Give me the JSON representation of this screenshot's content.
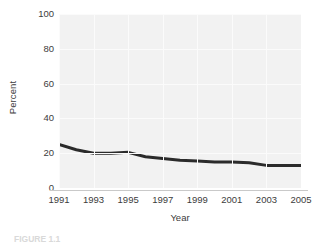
{
  "figure": {
    "caption_clipped": "FIGURE 1.1",
    "background_color": "#ffffff",
    "plot_background_color": "#f2f2f2",
    "gridline_color": "#fbfbfb",
    "axis_line_color": "#c9c9c9",
    "series_color": "#2b2b2b",
    "text_color": "#3c3c3c"
  },
  "chart_data": {
    "type": "line",
    "title": "",
    "xlabel": "Year",
    "ylabel": "Percent",
    "xlim": [
      1991,
      2005
    ],
    "ylim": [
      0,
      100
    ],
    "grid": true,
    "legend": false,
    "legend_position": "none",
    "x_tick_labels": [
      "1991",
      "1993",
      "1995",
      "1997",
      "1999",
      "2001",
      "2003",
      "2005"
    ],
    "x_ticks": [
      1991,
      1993,
      1995,
      1997,
      1999,
      2001,
      2003,
      2005
    ],
    "y_tick_labels": [
      "0",
      "20",
      "40",
      "60",
      "80",
      "100"
    ],
    "y_ticks": [
      0,
      20,
      40,
      60,
      80,
      100
    ],
    "x": [
      1991,
      1992,
      1993,
      1994,
      1995,
      1996,
      1997,
      1998,
      1999,
      2000,
      2001,
      2002,
      2003,
      2004,
      2005
    ],
    "values": [
      25,
      22,
      20,
      20,
      20.5,
      18,
      17,
      16,
      15.5,
      15,
      15,
      14.5,
      13,
      13,
      13
    ],
    "series": [
      {
        "name": "Percent",
        "color": "#2b2b2b",
        "line_width": 3,
        "values": [
          25,
          22,
          20,
          20,
          20.5,
          18,
          17,
          16,
          15.5,
          15,
          15,
          14.5,
          13,
          13,
          13
        ]
      }
    ]
  }
}
